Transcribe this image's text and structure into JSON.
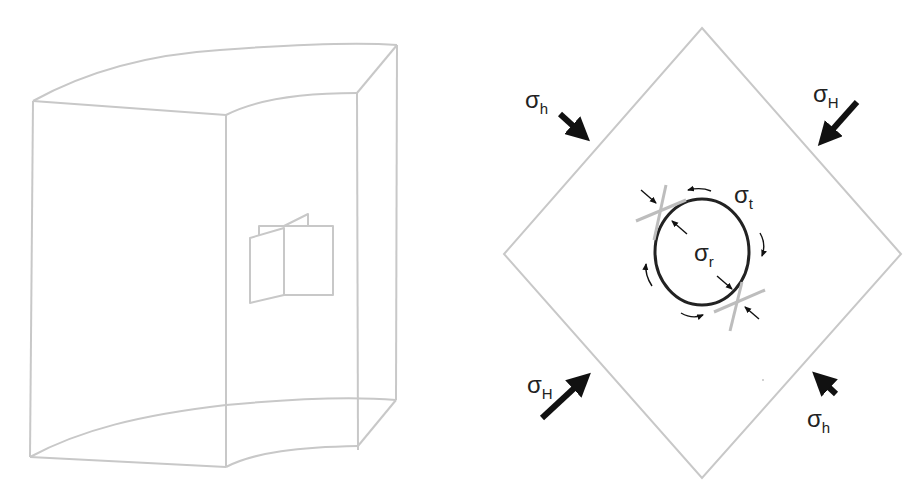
{
  "left_figure": {
    "description": "Wireframe curved block with folded fracture plane",
    "stroke_color": "#c8c8c8"
  },
  "right_figure": {
    "description": "Borehole in stress field, rotated square",
    "stroke_color": "#c8c8c8",
    "arrow_color": "#111111",
    "labels": {
      "sigma_h_top_left": {
        "symbol": "σ",
        "subscript": "h"
      },
      "sigma_H_top_right": {
        "symbol": "σ",
        "subscript": "H"
      },
      "sigma_H_bottom_left": {
        "symbol": "σ",
        "subscript": "H"
      },
      "sigma_h_bottom_right": {
        "symbol": "σ",
        "subscript": "h"
      },
      "sigma_t": {
        "symbol": "σ",
        "subscript": "t"
      },
      "sigma_r": {
        "symbol": "σ",
        "subscript": "r"
      }
    }
  }
}
